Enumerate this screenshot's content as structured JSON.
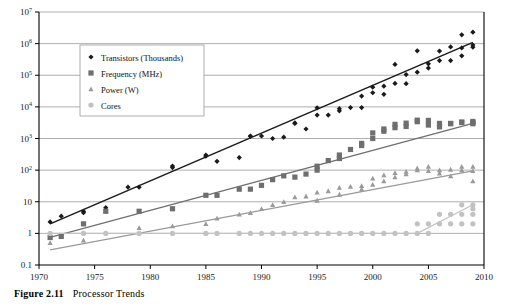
{
  "caption": {
    "number": "Figure 2.11",
    "title": "Processor Trends"
  },
  "colors": {
    "transistors": "#1a1a1a",
    "frequency": "#6e6e6e",
    "power": "#9a9a9a",
    "cores": "#c2c2c2",
    "grid": "#8c8c8c",
    "axis": "#000000",
    "legend_border": "#9a9a9a",
    "legend_bg": "#ffffff"
  },
  "chart_data": {
    "type": "scatter",
    "title": "Processor Trends",
    "xlabel": "",
    "ylabel": "",
    "xlim": [
      1970,
      2010
    ],
    "ylim": [
      0.1,
      10000000
    ],
    "yscale": "log",
    "xticks": [
      1970,
      1975,
      1980,
      1985,
      1990,
      1995,
      2000,
      2005,
      2010
    ],
    "xtick_labels": [
      "1970",
      "1975",
      "1980",
      "1985",
      "1990",
      "1995",
      "2000",
      "2005",
      "2010"
    ],
    "yticks": [
      0.1,
      1,
      10,
      100,
      1000,
      10000,
      100000,
      1000000,
      10000000
    ],
    "ytick_labels": [
      "0.1",
      "1",
      "10",
      "10^2",
      "10^3",
      "10^4",
      "10^5",
      "10^6",
      "10^7"
    ],
    "grid": true,
    "legend_position": "upper-left",
    "series": [
      {
        "name": "Transistors (Thousands)",
        "marker": "diamond",
        "color": "#1a1a1a",
        "trend": {
          "from": [
            1971,
            2.0
          ],
          "to": [
            2009,
            1100000
          ]
        },
        "points": [
          [
            1971,
            2.3
          ],
          [
            1972,
            3.5
          ],
          [
            1974,
            5.0
          ],
          [
            1974,
            4.5
          ],
          [
            1976,
            6.5
          ],
          [
            1978,
            29
          ],
          [
            1979,
            29
          ],
          [
            1982,
            134
          ],
          [
            1982,
            120
          ],
          [
            1985,
            275
          ],
          [
            1985,
            300
          ],
          [
            1986,
            190
          ],
          [
            1988,
            250
          ],
          [
            1989,
            1200
          ],
          [
            1989,
            1180
          ],
          [
            1990,
            1200
          ],
          [
            1991,
            1000
          ],
          [
            1992,
            1100
          ],
          [
            1993,
            3100
          ],
          [
            1993,
            3000
          ],
          [
            1994,
            2000
          ],
          [
            1995,
            5500
          ],
          [
            1995,
            9300
          ],
          [
            1996,
            5500
          ],
          [
            1997,
            7500
          ],
          [
            1997,
            8800
          ],
          [
            1998,
            9500
          ],
          [
            1999,
            9500
          ],
          [
            1999,
            22000
          ],
          [
            2000,
            42000
          ],
          [
            2000,
            28000
          ],
          [
            2001,
            25000
          ],
          [
            2001,
            45000
          ],
          [
            2002,
            55000
          ],
          [
            2002,
            220000
          ],
          [
            2003,
            105000
          ],
          [
            2003,
            54000
          ],
          [
            2004,
            125000
          ],
          [
            2004,
            592000
          ],
          [
            2005,
            169000
          ],
          [
            2005,
            230000
          ],
          [
            2006,
            291000
          ],
          [
            2006,
            582000
          ],
          [
            2007,
            291000
          ],
          [
            2007,
            789000
          ],
          [
            2008,
            410000
          ],
          [
            2008,
            731000
          ],
          [
            2008,
            1900000
          ],
          [
            2009,
            774000
          ],
          [
            2009,
            2300000
          ],
          [
            2009,
            904000
          ]
        ]
      },
      {
        "name": "Frequency (MHz)",
        "marker": "square",
        "color": "#6e6e6e",
        "trend": {
          "from": [
            1971,
            0.75
          ],
          "to": [
            2009,
            3000
          ]
        },
        "points": [
          [
            1971,
            0.74
          ],
          [
            1972,
            0.8
          ],
          [
            1974,
            2.0
          ],
          [
            1976,
            5.0
          ],
          [
            1979,
            5.0
          ],
          [
            1982,
            6.0
          ],
          [
            1985,
            16
          ],
          [
            1986,
            16
          ],
          [
            1988,
            25
          ],
          [
            1989,
            25
          ],
          [
            1990,
            33
          ],
          [
            1991,
            50
          ],
          [
            1992,
            66
          ],
          [
            1993,
            60
          ],
          [
            1994,
            75
          ],
          [
            1995,
            100
          ],
          [
            1995,
            133
          ],
          [
            1996,
            200
          ],
          [
            1997,
            233
          ],
          [
            1997,
            300
          ],
          [
            1998,
            450
          ],
          [
            1999,
            600
          ],
          [
            1999,
            700
          ],
          [
            2000,
            1000
          ],
          [
            2000,
            1500
          ],
          [
            2001,
            1700
          ],
          [
            2001,
            2000
          ],
          [
            2002,
            2200
          ],
          [
            2002,
            2800
          ],
          [
            2003,
            3060
          ],
          [
            2003,
            2400
          ],
          [
            2004,
            3400
          ],
          [
            2004,
            3800
          ],
          [
            2005,
            3730
          ],
          [
            2005,
            2660
          ],
          [
            2006,
            3000
          ],
          [
            2006,
            2330
          ],
          [
            2007,
            3000
          ],
          [
            2007,
            2930
          ],
          [
            2008,
            3200
          ],
          [
            2008,
            3330
          ],
          [
            2009,
            3460
          ],
          [
            2009,
            2930
          ],
          [
            2009,
            3200
          ]
        ]
      },
      {
        "name": "Power (W)",
        "marker": "triangle",
        "color": "#9a9a9a",
        "trend": {
          "from": [
            1971,
            0.3
          ],
          "to": [
            2009,
            95
          ]
        },
        "points": [
          [
            1971,
            0.5
          ],
          [
            1974,
            0.6
          ],
          [
            1979,
            1.5
          ],
          [
            1982,
            1.7
          ],
          [
            1985,
            2.0
          ],
          [
            1986,
            3.0
          ],
          [
            1988,
            4.0
          ],
          [
            1989,
            4.5
          ],
          [
            1990,
            6.0
          ],
          [
            1991,
            8.0
          ],
          [
            1992,
            10
          ],
          [
            1993,
            14
          ],
          [
            1994,
            15
          ],
          [
            1995,
            20
          ],
          [
            1995,
            11
          ],
          [
            1996,
            22
          ],
          [
            1997,
            28
          ],
          [
            1997,
            17
          ],
          [
            1998,
            30
          ],
          [
            1999,
            32
          ],
          [
            1999,
            25
          ],
          [
            2000,
            35
          ],
          [
            2000,
            55
          ],
          [
            2001,
            45
          ],
          [
            2001,
            70
          ],
          [
            2002,
            60
          ],
          [
            2002,
            82
          ],
          [
            2003,
            75
          ],
          [
            2003,
            90
          ],
          [
            2004,
            100
          ],
          [
            2004,
            115
          ],
          [
            2005,
            95
          ],
          [
            2005,
            130
          ],
          [
            2006,
            100
          ],
          [
            2006,
            80
          ],
          [
            2007,
            105
          ],
          [
            2007,
            65
          ],
          [
            2008,
            100
          ],
          [
            2008,
            130
          ],
          [
            2009,
            95
          ],
          [
            2009,
            45
          ],
          [
            2009,
            130
          ]
        ]
      },
      {
        "name": "Cores",
        "marker": "circle",
        "color": "#c2c2c2",
        "trend": {
          "from": [
            1971,
            1
          ],
          "to": [
            2009,
            8
          ]
        },
        "points": [
          [
            1971,
            1
          ],
          [
            1974,
            1
          ],
          [
            1976,
            1
          ],
          [
            1979,
            1
          ],
          [
            1982,
            1
          ],
          [
            1985,
            1
          ],
          [
            1986,
            1
          ],
          [
            1988,
            1
          ],
          [
            1989,
            1
          ],
          [
            1990,
            1
          ],
          [
            1991,
            1
          ],
          [
            1992,
            1
          ],
          [
            1993,
            1
          ],
          [
            1994,
            1
          ],
          [
            1995,
            1
          ],
          [
            1996,
            1
          ],
          [
            1997,
            1
          ],
          [
            1998,
            1
          ],
          [
            1999,
            1
          ],
          [
            2000,
            1
          ],
          [
            2001,
            1
          ],
          [
            2002,
            1
          ],
          [
            2003,
            1
          ],
          [
            2004,
            1
          ],
          [
            2004,
            2
          ],
          [
            2005,
            2
          ],
          [
            2005,
            1
          ],
          [
            2006,
            2
          ],
          [
            2006,
            4
          ],
          [
            2007,
            2
          ],
          [
            2007,
            4
          ],
          [
            2008,
            4
          ],
          [
            2008,
            2
          ],
          [
            2008,
            8
          ],
          [
            2009,
            4
          ],
          [
            2009,
            6
          ],
          [
            2009,
            8
          ],
          [
            2009,
            2
          ]
        ]
      }
    ]
  }
}
